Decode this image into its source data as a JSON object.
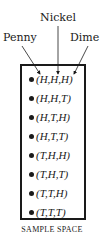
{
  "labels": {
    "penny": "Penny",
    "nickel": "Nickel",
    "dime": "Dime"
  },
  "outcomes": [
    "(H,H,H)",
    "(H,H,T)",
    "(H,T,H)",
    "(H,T,T)",
    "(T,H,H)",
    "(T,H,T)",
    "(T,T,H)",
    "(T,T,T)"
  ],
  "caption": "SAMPLE SPACE"
}
